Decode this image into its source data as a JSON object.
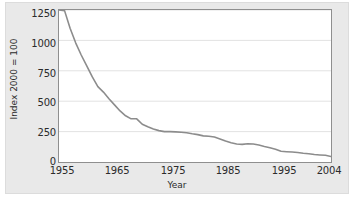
{
  "chart_data": {
    "type": "line",
    "title": "",
    "xlabel": "Year",
    "ylabel": "Index 2000 = 100",
    "xlim": [
      1955,
      2004
    ],
    "ylim": [
      0,
      1250
    ],
    "xticks": [
      1955,
      1965,
      1975,
      1985,
      1995,
      2004
    ],
    "xtick_labels": [
      "1955",
      "1965",
      "1975",
      "1985",
      "1995",
      "2004"
    ],
    "yticks": [
      0,
      250,
      500,
      750,
      1000,
      1250
    ],
    "ytick_labels": [
      "0",
      "250",
      "500",
      "750",
      "1000",
      "1250"
    ],
    "grid": "horizontal",
    "legend": "none",
    "line_color": "#8c8c8c",
    "series": [
      {
        "name": "Index 2000 = 100",
        "x": [
          1955,
          1956,
          1957,
          1958,
          1959,
          1960,
          1961,
          1962,
          1963,
          1964,
          1965,
          1966,
          1967,
          1968,
          1969,
          1970,
          1971,
          1972,
          1973,
          1974,
          1975,
          1976,
          1977,
          1978,
          1979,
          1980,
          1981,
          1982,
          1983,
          1984,
          1985,
          1986,
          1987,
          1988,
          1989,
          1990,
          1991,
          1992,
          1993,
          1994,
          1995,
          1996,
          1997,
          1998,
          1999,
          2000,
          2001,
          2002,
          2003,
          2004
        ],
        "values": [
          1250,
          1245,
          1100,
          980,
          880,
          790,
          700,
          620,
          575,
          520,
          470,
          420,
          380,
          355,
          355,
          310,
          290,
          272,
          258,
          250,
          250,
          248,
          245,
          240,
          232,
          225,
          215,
          212,
          205,
          190,
          172,
          158,
          148,
          145,
          150,
          148,
          140,
          128,
          118,
          105,
          88,
          85,
          82,
          78,
          72,
          68,
          62,
          58,
          55,
          45
        ]
      }
    ]
  },
  "axes": {
    "x_label": "Year",
    "y_label": "Index 2000 = 100"
  },
  "colors": {
    "line": "#8c8c8c",
    "grid": "#e2e2e2",
    "axis_frame": "#8f8f8f",
    "figure_background": "#e9e9e9",
    "plot_background": "#ffffff",
    "tick_text": "#2b2b2b"
  }
}
